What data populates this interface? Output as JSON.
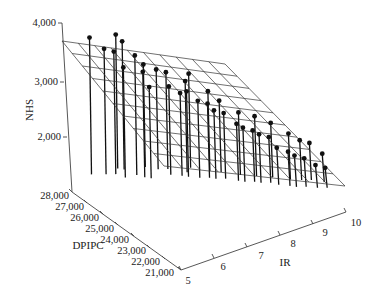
{
  "chart_data": {
    "type": "scatter3d",
    "title": "",
    "axes": {
      "z": {
        "label": "NHS",
        "ticks": [
          "2,000",
          "3,000",
          "4,000"
        ],
        "range": [
          1000,
          4000
        ]
      },
      "y": {
        "label": "DPIPC",
        "ticks": [
          "21,000",
          "22,000",
          "23,000",
          "24,000",
          "25,000",
          "26,000",
          "27,000",
          "28,000"
        ],
        "range": [
          21000,
          28000
        ]
      },
      "x": {
        "label": "IR",
        "ticks": [
          "5",
          "6",
          "7",
          "8",
          "9",
          "10"
        ],
        "range": [
          5,
          10
        ]
      }
    },
    "surface": {
      "type": "regression-plane",
      "grid": "10x10"
    },
    "points": [
      {
        "IR": 5.3,
        "DPIPC": 27500,
        "NHS": 3750
      },
      {
        "IR": 5.6,
        "DPIPC": 27200,
        "NHS": 3550
      },
      {
        "IR": 5.8,
        "DPIPC": 27000,
        "NHS": 3500
      },
      {
        "IR": 5.9,
        "DPIPC": 26600,
        "NHS": 3280
      },
      {
        "IR": 6.0,
        "DPIPC": 27300,
        "NHS": 3700
      },
      {
        "IR": 6.1,
        "DPIPC": 27100,
        "NHS": 3600
      },
      {
        "IR": 6.2,
        "DPIPC": 26500,
        "NHS": 3450
      },
      {
        "IR": 6.3,
        "DPIPC": 26200,
        "NHS": 3200
      },
      {
        "IR": 6.4,
        "DPIPC": 26000,
        "NHS": 2950
      },
      {
        "IR": 6.6,
        "DPIPC": 26800,
        "NHS": 3150
      },
      {
        "IR": 6.8,
        "DPIPC": 26400,
        "NHS": 3100
      },
      {
        "IR": 6.9,
        "DPIPC": 25800,
        "NHS": 2900
      },
      {
        "IR": 7.0,
        "DPIPC": 26200,
        "NHS": 3050
      },
      {
        "IR": 7.1,
        "DPIPC": 25500,
        "NHS": 2800
      },
      {
        "IR": 7.2,
        "DPIPC": 25300,
        "NHS": 2850
      },
      {
        "IR": 7.3,
        "DPIPC": 25600,
        "NHS": 2950
      },
      {
        "IR": 7.4,
        "DPIPC": 25000,
        "NHS": 2700
      },
      {
        "IR": 7.5,
        "DPIPC": 25800,
        "NHS": 3000
      },
      {
        "IR": 7.6,
        "DPIPC": 24800,
        "NHS": 2650
      },
      {
        "IR": 7.7,
        "DPIPC": 24600,
        "NHS": 2550
      },
      {
        "IR": 7.8,
        "DPIPC": 25200,
        "NHS": 2750
      },
      {
        "IR": 7.9,
        "DPIPC": 24400,
        "NHS": 2500
      },
      {
        "IR": 8.0,
        "DPIPC": 24900,
        "NHS": 2600
      },
      {
        "IR": 8.1,
        "DPIPC": 24000,
        "NHS": 2350
      },
      {
        "IR": 8.2,
        "DPIPC": 23800,
        "NHS": 2300
      },
      {
        "IR": 8.3,
        "DPIPC": 24300,
        "NHS": 2450
      },
      {
        "IR": 8.4,
        "DPIPC": 23600,
        "NHS": 2250
      },
      {
        "IR": 8.5,
        "DPIPC": 23400,
        "NHS": 2200
      },
      {
        "IR": 8.6,
        "DPIPC": 23900,
        "NHS": 2400
      },
      {
        "IR": 8.7,
        "DPIPC": 23200,
        "NHS": 2150
      },
      {
        "IR": 8.8,
        "DPIPC": 22900,
        "NHS": 2000
      },
      {
        "IR": 8.9,
        "DPIPC": 23500,
        "NHS": 2300
      },
      {
        "IR": 9.0,
        "DPIPC": 22600,
        "NHS": 1950
      },
      {
        "IR": 9.1,
        "DPIPC": 22400,
        "NHS": 1900
      },
      {
        "IR": 9.2,
        "DPIPC": 23000,
        "NHS": 2150
      },
      {
        "IR": 9.3,
        "DPIPC": 22200,
        "NHS": 1850
      },
      {
        "IR": 9.4,
        "DPIPC": 22700,
        "NHS": 2050
      },
      {
        "IR": 9.5,
        "DPIPC": 21900,
        "NHS": 1750
      },
      {
        "IR": 9.6,
        "DPIPC": 22500,
        "NHS": 2000
      },
      {
        "IR": 9.7,
        "DPIPC": 21700,
        "NHS": 1700
      },
      {
        "IR": 9.8,
        "DPIPC": 22100,
        "NHS": 1850
      }
    ],
    "grid": false,
    "legend": null
  },
  "labels": {
    "z_axis_title": "NHS",
    "y_axis_title": "DPIPC",
    "x_axis_title": "IR",
    "z_ticks": [
      "4,000",
      "3,000",
      "2,000"
    ],
    "y_ticks": [
      "28,000",
      "27,000",
      "26,000",
      "25,000",
      "24,000",
      "23,000",
      "22,000",
      "21,000"
    ],
    "x_ticks": [
      "5",
      "6",
      "7",
      "8",
      "9",
      "10"
    ]
  },
  "colors": {
    "stem": "#111111",
    "marker": "#111111",
    "plane": "#333333",
    "axis": "#444444",
    "text": "#222222"
  }
}
